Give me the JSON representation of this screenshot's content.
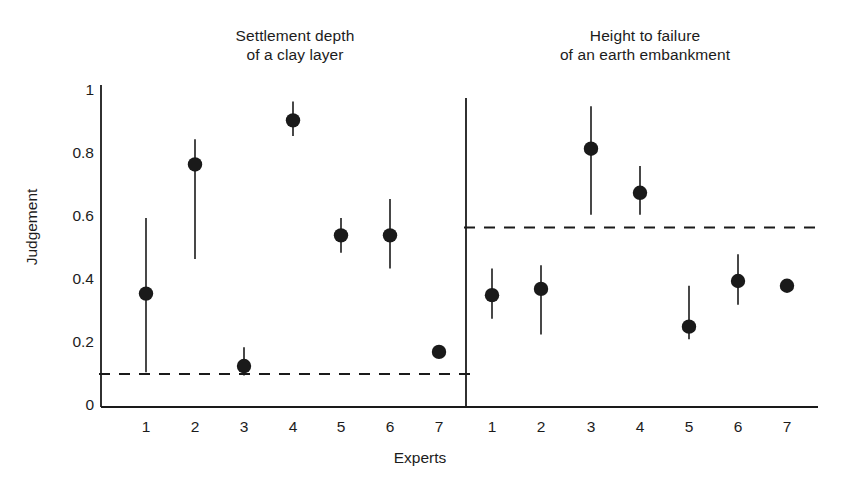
{
  "figure": {
    "ylabel": "Judgement",
    "xlabel": "Experts",
    "panels": [
      {
        "id": "left",
        "title": "Settlement depth\nof a clay layer"
      },
      {
        "id": "right",
        "title": "Height to failure\nof an earth embankment"
      }
    ]
  },
  "chart_data": {
    "type": "scatter",
    "title": "",
    "xlabel": "Experts",
    "ylabel": "Judgement",
    "ylim": [
      0,
      1
    ],
    "yticks": [
      0,
      0.2,
      0.4,
      0.6,
      0.8,
      1
    ],
    "ytick_labels": [
      "0",
      "0.2",
      "0.4",
      "0.6",
      "0.8",
      "1"
    ],
    "grid": false,
    "legend": "none",
    "marker": "filled-circle",
    "error_bars": "vertical-range",
    "panels": [
      {
        "name": "Settlement depth of a clay layer",
        "title_lines": [
          "Settlement depth",
          "of a clay layer"
        ],
        "categories": [
          "1",
          "2",
          "3",
          "4",
          "5",
          "6",
          "7"
        ],
        "xtick_labels": [
          "1",
          "2",
          "3",
          "4",
          "5",
          "6",
          "7"
        ],
        "reference_line": 0.105,
        "reference_line_style": "dashed",
        "points": [
          {
            "x": "1",
            "value": 0.36,
            "low": 0.11,
            "high": 0.6
          },
          {
            "x": "2",
            "value": 0.77,
            "low": 0.47,
            "high": 0.85
          },
          {
            "x": "3",
            "value": 0.13,
            "low": 0.1,
            "high": 0.19
          },
          {
            "x": "4",
            "value": 0.91,
            "low": 0.86,
            "high": 0.97
          },
          {
            "x": "5",
            "value": 0.545,
            "low": 0.49,
            "high": 0.6
          },
          {
            "x": "6",
            "value": 0.545,
            "low": 0.44,
            "high": 0.66
          },
          {
            "x": "7",
            "value": 0.175,
            "low": 0.175,
            "high": 0.175
          }
        ]
      },
      {
        "name": "Height to failure of an earth embankment",
        "title_lines": [
          "Height to failure",
          "of an earth embankment"
        ],
        "categories": [
          "1",
          "2",
          "3",
          "4",
          "5",
          "6",
          "7"
        ],
        "xtick_labels": [
          "1",
          "2",
          "3",
          "4",
          "5",
          "6",
          "7"
        ],
        "reference_line": 0.57,
        "reference_line_style": "dashed",
        "points": [
          {
            "x": "1",
            "value": 0.355,
            "low": 0.28,
            "high": 0.44
          },
          {
            "x": "2",
            "value": 0.375,
            "low": 0.23,
            "high": 0.45
          },
          {
            "x": "3",
            "value": 0.82,
            "low": 0.61,
            "high": 0.955
          },
          {
            "x": "4",
            "value": 0.68,
            "low": 0.61,
            "high": 0.765
          },
          {
            "x": "5",
            "value": 0.255,
            "low": 0.215,
            "high": 0.385
          },
          {
            "x": "6",
            "value": 0.4,
            "low": 0.325,
            "high": 0.485
          },
          {
            "x": "7",
            "value": 0.385,
            "low": 0.385,
            "high": 0.385
          }
        ]
      }
    ]
  },
  "style": {
    "ink": "#1a1a1a",
    "background": "#ffffff"
  }
}
